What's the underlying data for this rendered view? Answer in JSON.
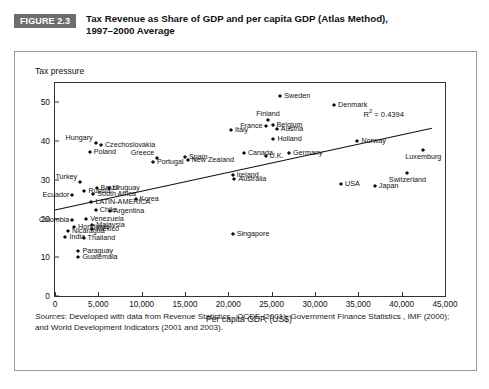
{
  "header": {
    "figure_tag": "FIGURE 2.3",
    "title_line1": "Tax Revenue as Share of GDP and per capita GDP (Atlas Method),",
    "title_line2": "1997–2000 Average"
  },
  "source": {
    "label": "Sources",
    "text": ": Developed with data from Revenue Statistics , OCDE (2001), Government Finance Statistics , IMF (2000); and World Development Indicators (2001 and 2003)."
  },
  "chart_data": {
    "type": "scatter",
    "title": "Tax Revenue as Share of GDP and per capita GDP (Atlas Method), 1997–2000 Average",
    "xlabel": "Per capita GDP, (US$)",
    "ylabel": "Tax pressure",
    "xlim": [
      0,
      45000
    ],
    "ylim": [
      0,
      55
    ],
    "xticks": [
      0,
      5000,
      10000,
      15000,
      20000,
      25000,
      30000,
      35000,
      40000,
      45000
    ],
    "xticklabels": [
      "0",
      "5,000",
      "10,000",
      "15,000",
      "20,000",
      "25,000",
      "30,000",
      "35,000",
      "40,000",
      "45,000"
    ],
    "yticks": [
      0,
      10,
      20,
      30,
      40,
      50
    ],
    "yticklabels": [
      "0",
      "10",
      "20",
      "30",
      "40",
      "50"
    ],
    "grid": false,
    "legend": null,
    "annotation": "R² = 0.4394",
    "r_squared": 0.4394,
    "trendline": {
      "x0": 0,
      "y0": 22.2,
      "x1": 43500,
      "y1": 43.3
    },
    "points": [
      {
        "label": "Sweden",
        "x": 26000,
        "y": 51.6,
        "lx": "right"
      },
      {
        "label": "Denmark",
        "x": 32200,
        "y": 49.2,
        "lx": "right"
      },
      {
        "label": "Finland",
        "x": 24600,
        "y": 45.4,
        "lx": "center-up"
      },
      {
        "label": "Belgium",
        "x": 25100,
        "y": 44.2,
        "lx": "right"
      },
      {
        "label": "France",
        "x": 24300,
        "y": 44.0,
        "lx": "left"
      },
      {
        "label": "Austria",
        "x": 25600,
        "y": 43.0,
        "lx": "right"
      },
      {
        "label": "Italy",
        "x": 20300,
        "y": 42.8,
        "lx": "right"
      },
      {
        "label": "Holland",
        "x": 25200,
        "y": 40.6,
        "lx": "right"
      },
      {
        "label": "Norway",
        "x": 34900,
        "y": 40.1,
        "lx": "right"
      },
      {
        "label": "Hungary",
        "x": 4700,
        "y": 39.6,
        "lx": "left-up"
      },
      {
        "label": "Czechoslovakia",
        "x": 5300,
        "y": 39.0,
        "lx": "right"
      },
      {
        "label": "Luxemburg",
        "x": 42500,
        "y": 37.8,
        "lx": "center-dn"
      },
      {
        "label": "Poland",
        "x": 4000,
        "y": 37.2,
        "lx": "right"
      },
      {
        "label": "Germany",
        "x": 27000,
        "y": 36.9,
        "lx": "right"
      },
      {
        "label": "Canada",
        "x": 21800,
        "y": 36.8,
        "lx": "right"
      },
      {
        "label": "Spain",
        "x": 15000,
        "y": 36.0,
        "lx": "right"
      },
      {
        "label": "Greece",
        "x": 11800,
        "y": 35.6,
        "lx": "left-up"
      },
      {
        "label": "New Zealand",
        "x": 15300,
        "y": 35.0,
        "lx": "right"
      },
      {
        "label": "Portugal",
        "x": 11300,
        "y": 34.6,
        "lx": "right"
      },
      {
        "label": "U.K.",
        "x": 24300,
        "y": 36.1,
        "lx": "right"
      },
      {
        "label": "Switzerland",
        "x": 40600,
        "y": 31.7,
        "lx": "center-dn"
      },
      {
        "label": "Ireland",
        "x": 20500,
        "y": 31.2,
        "lx": "right"
      },
      {
        "label": "Australia",
        "x": 20700,
        "y": 30.3,
        "lx": "right"
      },
      {
        "label": "Turkey",
        "x": 2900,
        "y": 29.4,
        "lx": "left-up"
      },
      {
        "label": "USA",
        "x": 33000,
        "y": 29.0,
        "lx": "right"
      },
      {
        "label": "Japan",
        "x": 36900,
        "y": 28.3,
        "lx": "right"
      },
      {
        "label": "Brazil",
        "x": 4800,
        "y": 28.0,
        "lx": "right"
      },
      {
        "label": "Uruguay",
        "x": 6200,
        "y": 27.8,
        "lx": "right"
      },
      {
        "label": "Russia",
        "x": 3400,
        "y": 27.0,
        "lx": "right"
      },
      {
        "label": "South Africa",
        "x": 4400,
        "y": 26.3,
        "lx": "right"
      },
      {
        "label": "Ecuador",
        "x": 2000,
        "y": 26.2,
        "lx": "left"
      },
      {
        "label": "Korea",
        "x": 9300,
        "y": 25.0,
        "lx": "right"
      },
      {
        "label": "LATIN-AMERICA",
        "x": 4200,
        "y": 24.2,
        "lx": "right"
      },
      {
        "label": "Chile",
        "x": 4700,
        "y": 22.2,
        "lx": "right"
      },
      {
        "label": "Argentina",
        "x": 6300,
        "y": 22.0,
        "lx": "right"
      },
      {
        "label": "Colombia",
        "x": 2000,
        "y": 19.6,
        "lx": "left"
      },
      {
        "label": "Venezuela",
        "x": 3600,
        "y": 19.8,
        "lx": "right"
      },
      {
        "label": "Malaysia",
        "x": 4300,
        "y": 18.4,
        "lx": "right"
      },
      {
        "label": "Honduras",
        "x": 2200,
        "y": 17.9,
        "lx": "right"
      },
      {
        "label": "Mexico",
        "x": 4300,
        "y": 17.2,
        "lx": "right"
      },
      {
        "label": "Nicaragua",
        "x": 1500,
        "y": 16.8,
        "lx": "right"
      },
      {
        "label": "Singapore",
        "x": 20500,
        "y": 16.0,
        "lx": "right"
      },
      {
        "label": "India",
        "x": 1200,
        "y": 15.2,
        "lx": "right"
      },
      {
        "label": "Thailand",
        "x": 3300,
        "y": 15.1,
        "lx": "right"
      },
      {
        "label": "Paraguay",
        "x": 2700,
        "y": 11.6,
        "lx": "right"
      },
      {
        "label": "Guatemala",
        "x": 2700,
        "y": 10.0,
        "lx": "right"
      }
    ]
  }
}
